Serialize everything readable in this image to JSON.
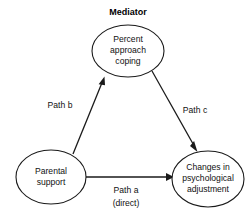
{
  "diagram": {
    "title": "Mediator",
    "background_color": "#ffffff",
    "stroke_color": "#1a1a1a",
    "text_color": "#111111",
    "nodes": [
      {
        "id": "mediator",
        "shape": "ellipse",
        "lines": [
          "Percent",
          "approach",
          "coping"
        ],
        "line1": "Percent",
        "line2": "approach",
        "line3": "coping",
        "cx": 128,
        "cy": 51,
        "rx": 36,
        "ry": 26
      },
      {
        "id": "predictor",
        "shape": "ellipse",
        "lines": [
          "Parental",
          "support"
        ],
        "line1": "Parental",
        "line2": "support",
        "cx": 51,
        "cy": 177,
        "rx": 35,
        "ry": 27
      },
      {
        "id": "outcome",
        "shape": "ellipse",
        "lines": [
          "Changes in",
          "psychological",
          "adjustment"
        ],
        "line1": "Changes in",
        "line2": "psychological",
        "line3": "adjustment",
        "cx": 208,
        "cy": 179,
        "rx": 36,
        "ry": 28
      }
    ],
    "edges": [
      {
        "id": "path-b",
        "label": "Path b",
        "label_x": 60,
        "label_y": 106,
        "from": "predictor",
        "to": "mediator"
      },
      {
        "id": "path-c",
        "label": "Path c",
        "label_x": 195,
        "label_y": 111,
        "from": "mediator",
        "to": "outcome"
      },
      {
        "id": "path-a",
        "label": "Path a",
        "sublabel": "(direct)",
        "label_x": 126,
        "label_y": 191,
        "sublabel_y": 204,
        "from": "predictor",
        "to": "outcome"
      }
    ]
  }
}
